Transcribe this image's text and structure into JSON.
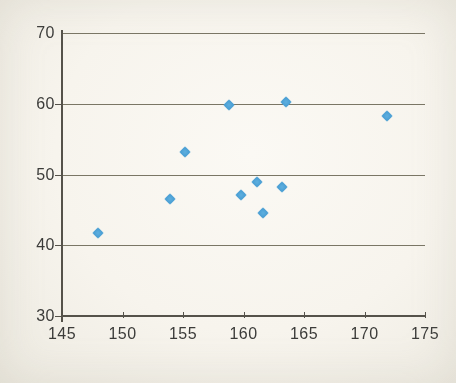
{
  "chart_data": {
    "type": "scatter",
    "points": [
      {
        "x": 148.0,
        "y": 41.8
      },
      {
        "x": 153.9,
        "y": 46.6
      },
      {
        "x": 155.2,
        "y": 53.2
      },
      {
        "x": 158.8,
        "y": 59.8
      },
      {
        "x": 159.8,
        "y": 47.1
      },
      {
        "x": 161.1,
        "y": 48.9
      },
      {
        "x": 161.6,
        "y": 44.5
      },
      {
        "x": 163.2,
        "y": 48.2
      },
      {
        "x": 163.5,
        "y": 60.2
      },
      {
        "x": 171.9,
        "y": 58.3
      }
    ],
    "xlim": [
      145,
      175
    ],
    "ylim": [
      30,
      70
    ],
    "x_ticks": [
      145,
      150,
      155,
      160,
      165,
      170,
      175
    ],
    "y_ticks": [
      30,
      40,
      50,
      60,
      70
    ],
    "xlabel": "",
    "ylabel": "",
    "grid": "horizontal-only",
    "legend": "none",
    "marker": {
      "shape": "diamond",
      "size_px": 11,
      "color": "#4b9fd4",
      "color_center": "#5fb0e0"
    },
    "colors": {
      "background": "#f7f4ed",
      "gridline": "#7a7665",
      "axis": "#55524a",
      "label_text": "#3c3c3a"
    }
  }
}
